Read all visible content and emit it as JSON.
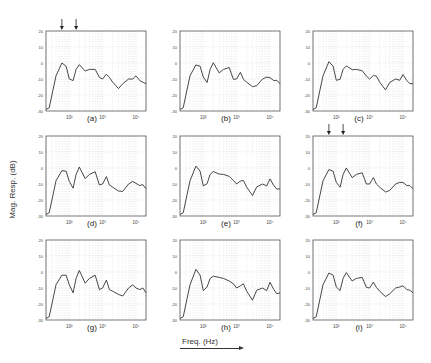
{
  "figure": {
    "ylabel": "Mag. Resp. (dB)",
    "xlabel": "Freq. (Hz)",
    "yticks": [
      "20",
      "10",
      "0",
      "-10",
      "-20",
      "-30"
    ],
    "xticks": [
      "10²",
      "10³",
      "10⁴"
    ],
    "panels": [
      {
        "label": "(a)",
        "arrows": true
      },
      {
        "label": "(b)",
        "arrows": false
      },
      {
        "label": "(c)",
        "arrows": false
      },
      {
        "label": "(d)",
        "arrows": false
      },
      {
        "label": "(e)",
        "arrows": false
      },
      {
        "label": "(f)",
        "arrows": true
      },
      {
        "label": "(g)",
        "arrows": false
      },
      {
        "label": "(h)",
        "arrows": false
      },
      {
        "label": "(i)",
        "arrows": false
      }
    ]
  },
  "chart_data": {
    "type": "line",
    "title": "",
    "xlabel": "Freq. (Hz)",
    "ylabel": "Mag. Resp. (dB)",
    "xscale": "log",
    "xlim": [
      20,
      20000
    ],
    "ylim": [
      -30,
      20
    ],
    "grid": true,
    "layout": "3x3 small multiples",
    "panels": [
      "(a)",
      "(b)",
      "(c)",
      "(d)",
      "(e)",
      "(f)",
      "(g)",
      "(h)",
      "(i)"
    ],
    "series": [
      {
        "name": "magnitude response (typical)",
        "x": [
          20,
          25,
          40,
          60,
          80,
          100,
          130,
          160,
          200,
          300,
          400,
          600,
          800,
          1000,
          1300,
          1600,
          2000,
          3000,
          4000,
          6000,
          8000,
          10000,
          13000,
          16000,
          20000
        ],
        "values": [
          -29,
          -28,
          -8,
          0,
          -2,
          -10,
          -11,
          -4,
          -1,
          -5,
          -4,
          -4,
          -9,
          -10,
          -7,
          -9,
          -12,
          -16,
          -13,
          -10,
          -10,
          -8,
          -11,
          -12,
          -13
        ]
      }
    ],
    "annotations": [
      "two downward arrows above panels (a) and (f) marking low-frequency peaks"
    ]
  }
}
